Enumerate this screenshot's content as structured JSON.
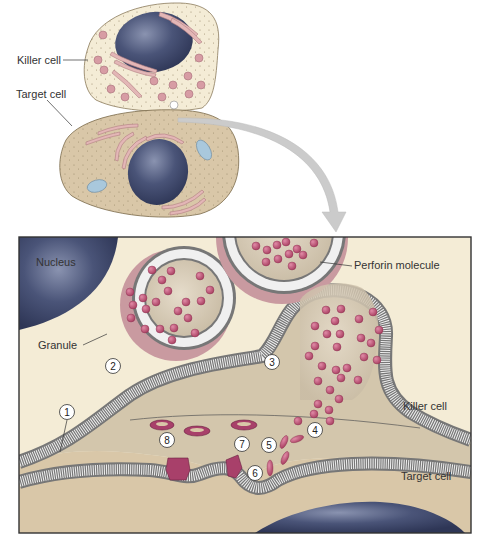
{
  "figure": {
    "overview": {
      "labels": {
        "killer_cell": "Killer cell",
        "target_cell": "Target cell"
      }
    },
    "detail": {
      "labels": {
        "nucleus": "Nucleus",
        "perforin_molecule": "Perforin molecule",
        "granule": "Granule",
        "killer_cell": "Killer cell",
        "target_cell": "Target cell"
      },
      "steps": [
        "1",
        "2",
        "3",
        "4",
        "5",
        "6",
        "7",
        "8"
      ]
    },
    "colors": {
      "killer_cytoplasm": "#f4ecd6",
      "target_cytoplasm": "#d9c7a8",
      "nucleus": "#3f4a6e",
      "granule_interior": "#d9cdb8",
      "granule_rim": "#c99aa0",
      "perforin": "#b8506e",
      "membrane": "#e8e8e8",
      "membrane_heads": "#7a7a7a",
      "arrow": "#c8c8c8",
      "frame": "#333333"
    }
  }
}
